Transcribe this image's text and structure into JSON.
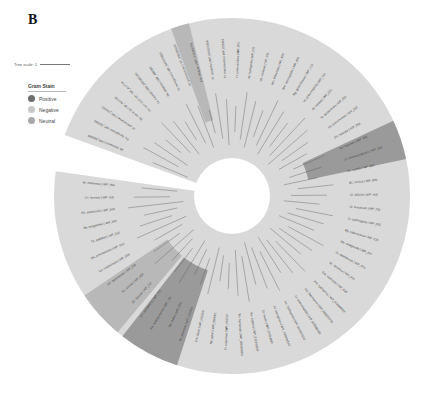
{
  "figure": {
    "panel_letter": "B",
    "tree_scale_label": "Tree scale: 1",
    "legend": {
      "title": "Gram Stain",
      "items": [
        {
          "label": "Positive",
          "color": "#6e6e6e"
        },
        {
          "label": "Negative",
          "color": "#c8c8c8"
        },
        {
          "label": "Neutral",
          "color": "#a8a8a8"
        }
      ]
    },
    "center": {
      "x": 232,
      "y": 196
    },
    "colors": {
      "negative_ring": "#d9d9d9",
      "positive_sector": "#9a9a9a",
      "neutral_sector": "#b8b8b8",
      "branch": "#555555"
    },
    "leaf_labels": [
      "Ab. baumannii | WP_000000",
      "Ps. aeruginosa | WP_003000",
      "Kl. pneumoniae | WP_004000",
      "Ec. coli K-12 | NP_417730",
      "Ec. coli O157:H7 | NP_412724",
      "Ct. freundii | WP_032185431",
      "Se. enterica | WP_480360",
      "Kl. aerogenes | WP_047570923",
      "Kl. pneumoniae | YP_005226135",
      "Ent. cloacae | WP_014169779",
      "Pr. mirabilis | WP_004122308",
      "Sr. marcescens | WP_025302",
      "Yr. enterocolitica | WP_002",
      "Ae. hydrophila | WP_011",
      "Vb. cholerae | NP_231",
      "Hm. influenzae | NP_439",
      "Nm. meningitidis | WP_002",
      "Ng. gonorrhoeae | WP_003",
      "Le. pneumophila | WP_010",
      "St. aureus | WP_000",
      "St. epidermidis | WP_001",
      "Sp. pneumoniae | WP_000",
      "En. faecalis | WP_002",
      "En. faecium | WP_002",
      "Ls. monocytogenes | WP_003",
      "Bc. subtilis | NP_389",
      "Bc. cereus | WP_000",
      "Cl. difficile | WP_009",
      "Cl. botulinum | WP_011",
      "Cl. perfringens | WP_003",
      "My. tuberculosis | NP_215",
      "My. smegmatis | WP_011",
      "Cr. diphtheriae | WP_010",
      "Nc. farcinica | WP_011",
      "Sm. coelicolor | NP_625",
      "Am. hydrophila | WP_024648599",
      "Aci. baumannii | WP_000022778",
      "Lc. pneumophila | WP_025060102",
      "Ae. hydrophila | WP_024945153",
      "Kl. aerogenes | WP_015846530",
      "Ct. koseri | WP_00054880",
      "Bo. capacia | WP_011443918",
      "Bo. fischeriae | WP_005309003",
      "Fr. tularensis | WP_014237",
      "Hp. pylori | WP_000962",
      "Cm. jejuni | WP_002259",
      "Bd. pertussis | WP_010930",
      "Bu. mallei | WP_004",
      "Ra. solanacearum | WP_011",
      "Xn. campestris | WP_011",
      "Sh. flexneri | NP_707",
      "Sh. sonnei | WP_000",
      "Sh. dysenteriae | WP_005",
      "Ch. trachomatis | WP_009",
      "Mc. pneumoniae | WP_010",
      "Tp. pallidum | WP_010",
      "Bb. burgdorferi | WP_002",
      "Rk. prowazekii | WP_004",
      "Cx. burnetii | WP_005",
      "Br. melitensis | WP_004"
    ]
  }
}
